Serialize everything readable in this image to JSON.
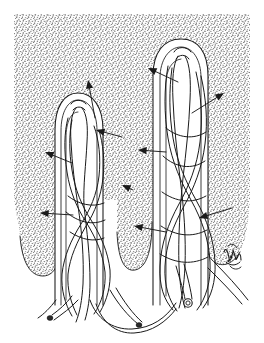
{
  "figure": {
    "title": "Intestinal villi with vascular network",
    "domain_label": "anatomical-line-drawing",
    "canvas": {
      "width": 264,
      "height": 343,
      "background": "#ffffff"
    },
    "style": {
      "ink_color": "#1a1a1a",
      "stipple_color": "#2a2a2a",
      "line_width": 1.0,
      "stipple_density": 0.3,
      "stipple_dot_size": 0.62
    },
    "stipple_field": {
      "name": "mucosa-background-stipple",
      "left": 14,
      "top": 14,
      "right": 250,
      "top_flat_edge": 14,
      "description": "dense stipple tissue field occupying upper rectangle, with rounded lobe bottoms descending between the villi"
    },
    "structures": [
      {
        "id": "villus-left",
        "name": "left-villus",
        "tip_x": 78,
        "tip_y": 98,
        "base_y": 300,
        "half_width": 22
      },
      {
        "id": "villus-right",
        "name": "right-villus",
        "tip_x": 180,
        "tip_y": 45,
        "base_y": 300,
        "half_width": 26
      }
    ],
    "vessel_ends": [
      {
        "name": "cut-vessel-end-lumen",
        "x": 188,
        "y": 303,
        "r": 4.2,
        "type": "open-lumen"
      },
      {
        "name": "vessel-tip-left",
        "x": 50,
        "y": 318,
        "r": 2.4,
        "type": "blunt-tip"
      },
      {
        "name": "vessel-tip-centre",
        "x": 139,
        "y": 325,
        "r": 2.4,
        "type": "blunt-tip"
      }
    ],
    "signature": {
      "name": "artist-signature-mark",
      "x": 232,
      "y": 258,
      "visible": true
    },
    "arrows": [
      {
        "id": "a1",
        "name": "arrow-to-left-villus-tip",
        "tail_x": 95,
        "tail_y": 118,
        "head_x": 88,
        "head_y": 80
      },
      {
        "id": "a2",
        "name": "arrow-to-left-villus-epithelium",
        "tail_x": 122,
        "tail_y": 137,
        "head_x": 96,
        "head_y": 130
      },
      {
        "id": "a3",
        "name": "arrow-to-left-villus-lamina",
        "tail_x": 72,
        "tail_y": 163,
        "head_x": 45,
        "head_y": 152
      },
      {
        "id": "a4",
        "name": "arrow-to-left-villus-base",
        "tail_x": 73,
        "tail_y": 215,
        "head_x": 40,
        "head_y": 213
      },
      {
        "id": "a5",
        "name": "arrow-to-capillary-plexus",
        "tail_x": 133,
        "tail_y": 190,
        "head_x": 122,
        "head_y": 185
      },
      {
        "id": "a6",
        "name": "arrow-to-right-villus-tip",
        "tail_x": 178,
        "tail_y": 82,
        "head_x": 148,
        "head_y": 68
      },
      {
        "id": "a7",
        "name": "arrow-to-right-villus-vessel",
        "tail_x": 192,
        "tail_y": 113,
        "head_x": 224,
        "head_y": 93
      },
      {
        "id": "a8",
        "name": "arrow-to-central-lacteal",
        "tail_x": 166,
        "tail_y": 152,
        "head_x": 138,
        "head_y": 150
      },
      {
        "id": "a9",
        "name": "arrow-to-crypt-region",
        "tail_x": 166,
        "tail_y": 232,
        "head_x": 134,
        "head_y": 226
      },
      {
        "id": "a10",
        "name": "arrow-to-submucosal-vessel",
        "tail_x": 232,
        "tail_y": 208,
        "head_x": 199,
        "head_y": 218
      }
    ]
  }
}
